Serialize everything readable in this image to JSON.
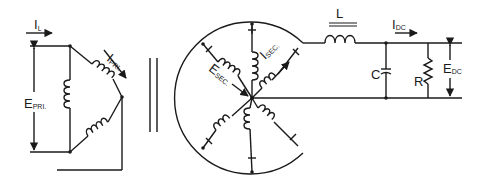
{
  "diagram": {
    "type": "rectifier-circuit",
    "primary": {
      "current_label": "I",
      "current_sub": "L",
      "primary_current_label": "I",
      "primary_current_sub": "PRI.",
      "voltage_label": "E",
      "voltage_sub": "PRI."
    },
    "transformer_core": "double-line-core",
    "secondary": {
      "current_label": "I",
      "current_sub": "SEC.",
      "voltage_label": "E",
      "voltage_sub": "SEC.",
      "phases": 6
    },
    "filter": {
      "inductor_label": "L",
      "capacitor_label": "C",
      "resistor_label": "R",
      "dc_current_label": "I",
      "dc_current_sub": "DC",
      "dc_voltage_label": "E",
      "dc_voltage_sub": "DC"
    }
  }
}
